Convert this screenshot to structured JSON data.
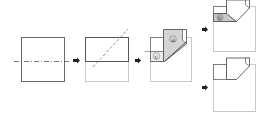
{
  "diagram": {
    "type": "paper-folding-steps",
    "colors": {
      "line_dark": "#555555",
      "line_light": "#bbbbbb",
      "flap_fill": "#d4d4d4",
      "arrow": "#222222",
      "background": "#ffffff"
    },
    "steps": [
      {
        "id": "step-1",
        "description": "Square paper with horizontal dash-dot fold line"
      },
      {
        "id": "step-2",
        "description": "Folded in half; diagonal dashed fold line"
      },
      {
        "id": "step-3",
        "description": "Diagonal fold with flaps",
        "labels": [
          "a",
          "c"
        ]
      },
      {
        "id": "step-4a",
        "description": "Result variant with flap",
        "labels": [
          "b"
        ]
      },
      {
        "id": "step-4b",
        "description": "Result variant without flap"
      }
    ],
    "labels": {
      "a": "a",
      "b": "b",
      "c": "c"
    },
    "arrow_glyph": "➡"
  }
}
